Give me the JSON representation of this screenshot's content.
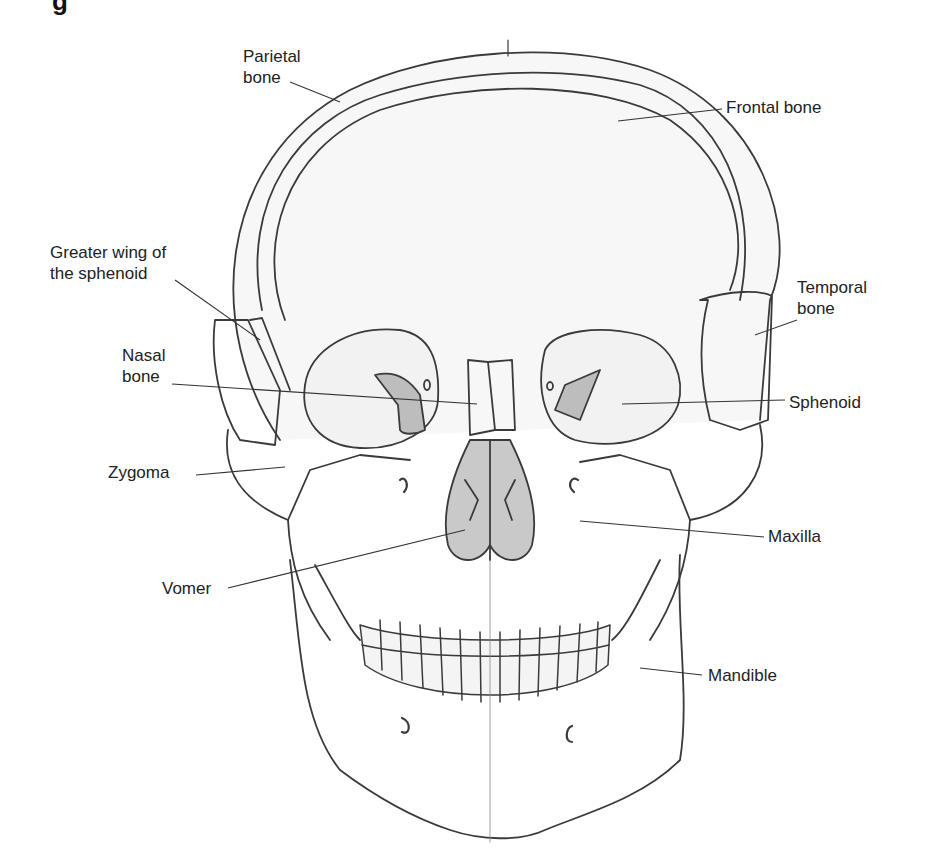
{
  "figure": {
    "caption_fragment": "g",
    "colors": {
      "line": "#3a3a3a",
      "bone_fill": "#f4f4f4",
      "shaded": "#bdbdbd",
      "text": "#222222"
    }
  },
  "labels": [
    {
      "id": "parietal",
      "text": "Parietal\nbone",
      "x": 243,
      "y": 46
    },
    {
      "id": "frontal",
      "text": "Frontal bone",
      "x": 726,
      "y": 97
    },
    {
      "id": "greater-wing",
      "text": "Greater wing of\nthe sphenoid",
      "x": 50,
      "y": 242
    },
    {
      "id": "temporal",
      "text": "Temporal\nbone",
      "x": 797,
      "y": 277
    },
    {
      "id": "nasal",
      "text": "Nasal\nbone",
      "x": 122,
      "y": 345
    },
    {
      "id": "sphenoid",
      "text": "Sphenoid",
      "x": 789,
      "y": 392
    },
    {
      "id": "zygoma",
      "text": "Zygoma",
      "x": 108,
      "y": 462
    },
    {
      "id": "maxilla",
      "text": "Maxilla",
      "x": 768,
      "y": 526
    },
    {
      "id": "vomer",
      "text": "Vomer",
      "x": 162,
      "y": 578
    },
    {
      "id": "mandible",
      "text": "Mandible",
      "x": 708,
      "y": 665
    }
  ]
}
